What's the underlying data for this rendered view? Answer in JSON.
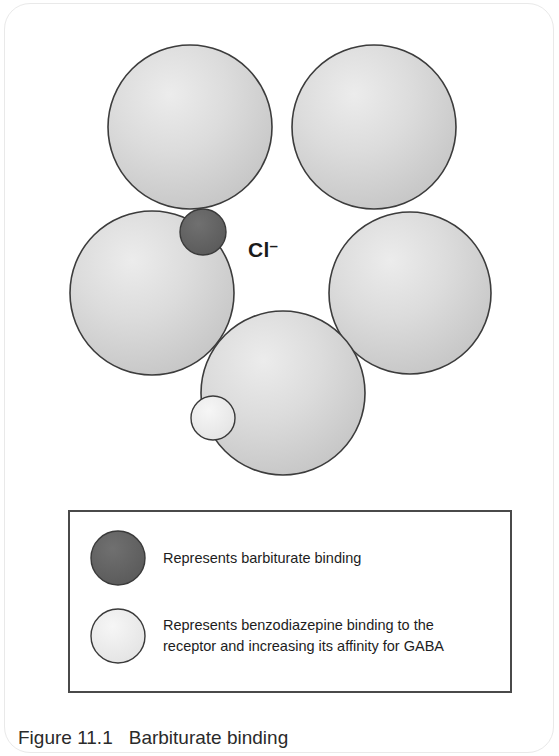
{
  "figure": {
    "caption_number": "Figure 11.1",
    "caption_title": "Barbiturate binding",
    "channel_label_text": "Cl",
    "channel_label_charge": "–"
  },
  "diagram": {
    "type": "receptor-subunit-schematic",
    "subunits": [
      {
        "name": "subunit-top-left",
        "cx": 190,
        "cy": 127,
        "r": 82
      },
      {
        "name": "subunit-top-right",
        "cx": 374,
        "cy": 127,
        "r": 82
      },
      {
        "name": "subunit-left",
        "cx": 152,
        "cy": 293,
        "r": 82
      },
      {
        "name": "subunit-right",
        "cx": 410,
        "cy": 293,
        "r": 81
      },
      {
        "name": "subunit-bottom",
        "cx": 283,
        "cy": 393,
        "r": 82
      }
    ],
    "binding_sites": [
      {
        "name": "barbiturate-binding-site",
        "cx": 203,
        "cy": 232,
        "r": 23,
        "fill": "#646464"
      },
      {
        "name": "benzodiazepine-binding-site",
        "cx": 213,
        "cy": 418,
        "r": 22,
        "fill": "#ededed"
      }
    ],
    "colors": {
      "subunit_fill": "#d2d2d2",
      "subunit_highlight": "#e8e8e8",
      "subunit_stroke": "#3c3c3c",
      "barbiturate_fill": "#646464",
      "benzodiazepine_fill": "#ededed",
      "legend_border": "#4a4a4a",
      "text": "#1d1d1d"
    }
  },
  "legend": {
    "items": [
      {
        "swatch_name": "barbiturate-swatch",
        "label": "Represents barbiturate binding"
      },
      {
        "swatch_name": "benzodiazepine-swatch",
        "label": "Represents benzodiazepine binding to the\nreceptor and increasing its affinity for GABA"
      }
    ]
  }
}
